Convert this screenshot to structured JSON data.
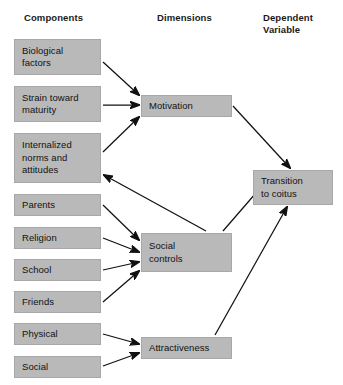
{
  "diagram": {
    "type": "flow-diagram",
    "headers": [
      {
        "id": "components",
        "label": "Components"
      },
      {
        "id": "dimensions",
        "label": "Dimensions"
      },
      {
        "id": "dependent-variable",
        "label": "Dependent\nVariable"
      }
    ],
    "columns": {
      "components": {
        "nodes": [
          {
            "id": "biological-factors",
            "label": "Biological\nfactors",
            "x": 14,
            "y": 39,
            "w": 87,
            "h": 36
          },
          {
            "id": "strain-toward-maturity",
            "label": "Strain toward\nmaturity",
            "x": 14,
            "y": 86,
            "w": 87,
            "h": 36
          },
          {
            "id": "internalized-norms-and-attitudes",
            "label": "Internalized\nnorms and\nattitudes",
            "x": 14,
            "y": 133,
            "w": 87,
            "h": 50
          },
          {
            "id": "parents",
            "label": "Parents",
            "x": 14,
            "y": 194,
            "w": 87,
            "h": 22
          },
          {
            "id": "religion",
            "label": "Religion",
            "x": 14,
            "y": 227,
            "w": 87,
            "h": 22
          },
          {
            "id": "school",
            "label": "School",
            "x": 14,
            "y": 259,
            "w": 87,
            "h": 22
          },
          {
            "id": "friends",
            "label": "Friends",
            "x": 14,
            "y": 291,
            "w": 87,
            "h": 22
          },
          {
            "id": "physical",
            "label": "Physical",
            "x": 14,
            "y": 323,
            "w": 87,
            "h": 22
          },
          {
            "id": "social",
            "label": "Social",
            "x": 14,
            "y": 356,
            "w": 87,
            "h": 22
          }
        ]
      },
      "dimensions": {
        "nodes": [
          {
            "id": "motivation",
            "label": "Motivation",
            "x": 141,
            "y": 95,
            "w": 91,
            "h": 22
          },
          {
            "id": "social-controls",
            "label": "Social\ncontrols",
            "x": 141,
            "y": 233,
            "w": 91,
            "h": 39
          },
          {
            "id": "attractiveness",
            "label": "Attractiveness",
            "x": 141,
            "y": 337,
            "w": 91,
            "h": 22
          }
        ]
      },
      "dependent_variable": {
        "nodes": [
          {
            "id": "transition-to-coitus",
            "label": "Transition\nto coitus",
            "x": 253,
            "y": 170,
            "w": 80,
            "h": 35
          }
        ]
      }
    },
    "edges": [
      {
        "id": "biological-factors-to-motivation",
        "from": "biological-factors",
        "to": "motivation"
      },
      {
        "id": "strain-toward-maturity-to-motivation",
        "from": "strain-toward-maturity",
        "to": "motivation"
      },
      {
        "id": "internalized-norms-to-motivation",
        "from": "internalized-norms-and-attitudes",
        "to": "motivation"
      },
      {
        "id": "parents-to-social-controls",
        "from": "parents",
        "to": "social-controls"
      },
      {
        "id": "religion-to-social-controls",
        "from": "religion",
        "to": "social-controls"
      },
      {
        "id": "school-to-social-controls",
        "from": "school",
        "to": "social-controls"
      },
      {
        "id": "friends-to-social-controls",
        "from": "friends",
        "to": "social-controls"
      },
      {
        "id": "physical-to-attractiveness",
        "from": "physical",
        "to": "attractiveness"
      },
      {
        "id": "social-to-attractiveness",
        "from": "social",
        "to": "attractiveness"
      },
      {
        "id": "social-controls-to-internalized-norms",
        "from": "social-controls",
        "to": "internalized-norms-and-attitudes"
      },
      {
        "id": "motivation-to-transition-to-coitus",
        "from": "motivation",
        "to": "transition-to-coitus"
      },
      {
        "id": "social-controls-to-transition-to-coitus",
        "from": "social-controls",
        "to": "transition-to-coitus"
      },
      {
        "id": "attractiveness-to-transition-to-coitus",
        "from": "attractiveness",
        "to": "transition-to-coitus"
      }
    ],
    "colors": {
      "node_fill": "#b9b9b9",
      "node_border": "#a8a8a8",
      "text": "#121212",
      "arrow": "#111111",
      "background": "#ffffff"
    }
  }
}
